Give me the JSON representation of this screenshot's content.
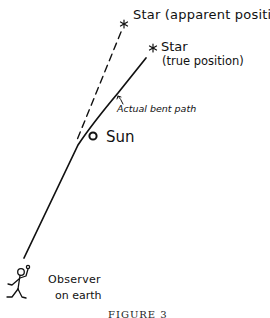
{
  "figure": {
    "caption": "FIGURE 3",
    "labels": {
      "star_apparent": "Star (apparent position)",
      "star_true_line1": "Star",
      "star_true_line2": "(true position)",
      "bent_path": "Actual bent path",
      "sun": "Sun",
      "observer_line1": "Observer",
      "observer_line2": "on earth"
    },
    "elements": {
      "apparent_star_marker": "asterisk",
      "true_star_marker": "asterisk",
      "sun_marker": "circle",
      "observer": "stick-figure",
      "apparent_line_style": "dashed",
      "true_path_style": "solid-curved"
    },
    "colors": {
      "ink": "#111111",
      "background": "#ffffff"
    }
  }
}
